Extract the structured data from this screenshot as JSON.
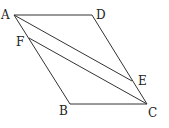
{
  "diagram": {
    "type": "parallelogram",
    "points": {
      "A": {
        "label": "A",
        "x": 14,
        "y": 15
      },
      "D": {
        "label": "D",
        "x": 92,
        "y": 15
      },
      "B": {
        "label": "B",
        "x": 70,
        "y": 104
      },
      "C": {
        "label": "C",
        "x": 147,
        "y": 104
      },
      "F": {
        "label": "F",
        "x": 29,
        "y": 38
      },
      "E": {
        "label": "E",
        "x": 132,
        "y": 81
      }
    },
    "segments": [
      "AD",
      "DC",
      "CB",
      "BA",
      "AE",
      "FC"
    ],
    "colors": {
      "line": "#333333",
      "text": "#222222"
    }
  }
}
